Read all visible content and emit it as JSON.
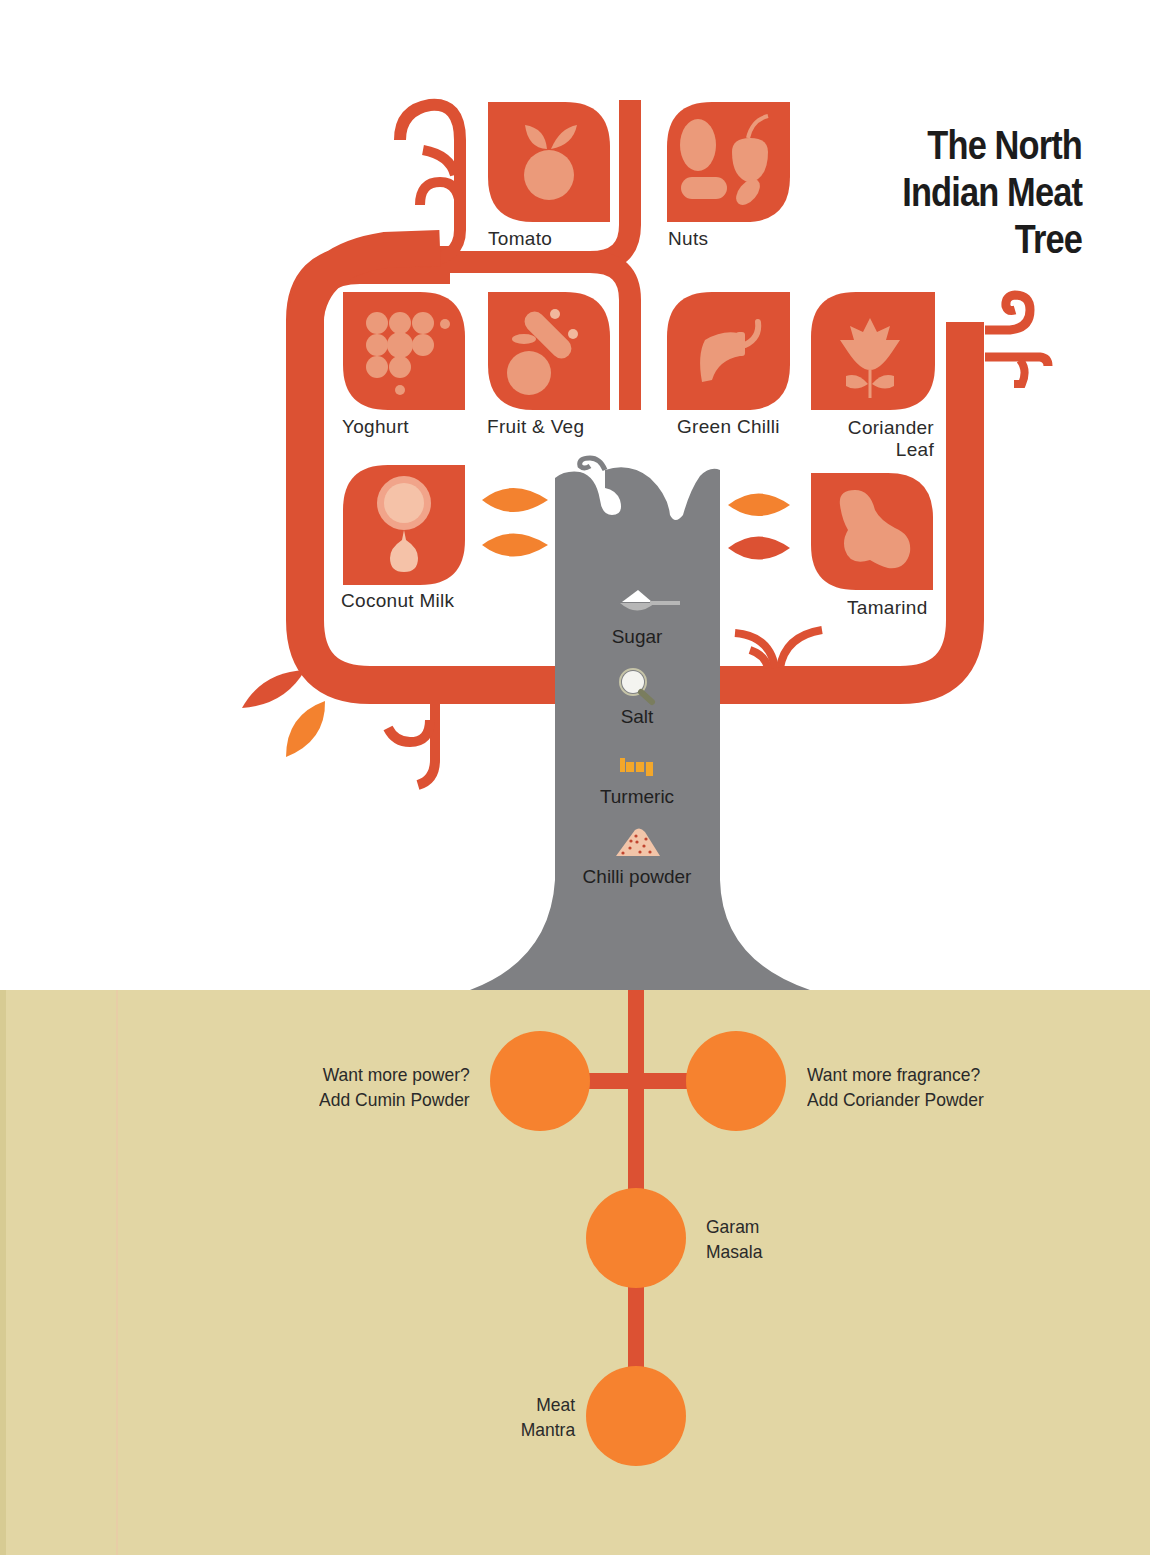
{
  "title": {
    "line1": "The North",
    "line2": "Indian Meat",
    "line3": "Tree"
  },
  "colors": {
    "branch": "#dc5133",
    "tile": "#dd5234",
    "tile_icon": "#eb9a7a",
    "leaf_orange": "#f3822f",
    "trunk": "#7f8083",
    "ground": "#e2d6a4",
    "root_circle": "#f6822f",
    "root_line": "#dc5133",
    "text": "#2b2b2b"
  },
  "branch_ingredients": [
    {
      "label": "Tomato",
      "icon": "tomato-icon"
    },
    {
      "label": "Nuts",
      "icon": "nuts-icon"
    },
    {
      "label": "Yoghurt",
      "icon": "yoghurt-icon"
    },
    {
      "label": "Fruit & Veg",
      "icon": "fruit-veg-icon"
    },
    {
      "label": "Green Chilli",
      "icon": "green-chilli-icon"
    },
    {
      "label": "Coriander",
      "label2": "Leaf",
      "icon": "coriander-leaf-icon"
    },
    {
      "label": "Coconut Milk",
      "icon": "coconut-milk-icon"
    },
    {
      "label": "Tamarind",
      "icon": "tamarind-icon"
    }
  ],
  "trunk_ingredients": [
    {
      "label": "Sugar",
      "icon": "sugar-spoon-icon"
    },
    {
      "label": "Salt",
      "icon": "salt-icon"
    },
    {
      "label": "Turmeric",
      "icon": "turmeric-icon"
    },
    {
      "label": "Chilli powder",
      "icon": "chilli-powder-icon"
    }
  ],
  "roots": {
    "left": {
      "line1": "Want more power?",
      "line2": "Add Cumin Powder"
    },
    "right": {
      "line1": "Want more fragrance?",
      "line2": "Add Coriander Powder"
    },
    "middle": {
      "line1": "Garam",
      "line2": "Masala"
    },
    "bottom": {
      "line1": "Meat",
      "line2": "Mantra"
    }
  }
}
